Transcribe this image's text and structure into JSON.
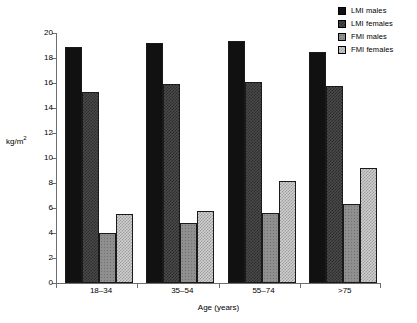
{
  "chart_data": {
    "type": "bar",
    "title": "",
    "subtitle": "",
    "xlabel": "Age (years)",
    "ylabel": "kg/m2",
    "ylabel_display": "kg/m",
    "ylabel_sup": "2",
    "categories": [
      "18–34",
      "35–54",
      "55–74",
      ">75"
    ],
    "series": [
      {
        "name": "LMI males",
        "values": [
          18.9,
          19.2,
          19.4,
          18.5
        ],
        "fill": "fill-lmi-males",
        "color": "#111111"
      },
      {
        "name": "LMI females",
        "values": [
          15.3,
          15.9,
          16.1,
          15.8
        ],
        "fill": "fill-lmi-females",
        "color": "#4a4a4a"
      },
      {
        "name": "FMI males",
        "values": [
          4.0,
          4.8,
          5.6,
          6.3
        ],
        "fill": "fill-fmi-males",
        "color": "#8f8f8f"
      },
      {
        "name": "FMI females",
        "values": [
          5.5,
          5.8,
          8.2,
          9.2
        ],
        "fill": "fill-fmi-females",
        "color": "#cfcfcf"
      }
    ],
    "ylim": [
      0,
      20
    ],
    "yticks": [
      0,
      2,
      4,
      6,
      8,
      10,
      12,
      14,
      16,
      18,
      20
    ],
    "ytick_labels": [
      "0",
      "2",
      "4",
      "6",
      "8",
      "10",
      "12",
      "14",
      "16",
      "18",
      "20"
    ],
    "grid": false,
    "legend_position": "top-right",
    "legend_entries": [
      "LMI males",
      "LMI females",
      "FMI males",
      "FMI females"
    ]
  }
}
